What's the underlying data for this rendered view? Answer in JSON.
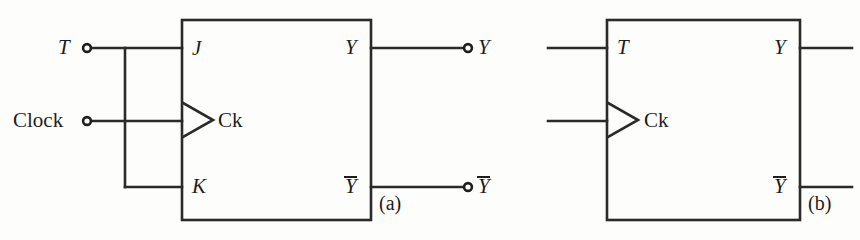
{
  "figure": {
    "background_color": "#fdfdfb",
    "line_color": "#2a2a2a",
    "text_color": "#1d1d1d"
  },
  "diagram_a": {
    "caption": "(a)",
    "external_inputs": [
      {
        "name": "T",
        "label": "T",
        "terminal": "open-circle"
      },
      {
        "name": "Clock",
        "label": "Clock",
        "terminal": "open-circle"
      }
    ],
    "box_input_pins": [
      {
        "name": "J",
        "label": "J"
      },
      {
        "name": "Ck",
        "label": "Ck"
      },
      {
        "name": "K",
        "label": "K"
      }
    ],
    "box_output_pins": [
      {
        "name": "Y",
        "label": "Y",
        "overbar": false
      },
      {
        "name": "Ybar",
        "label": "Y",
        "overbar": true
      }
    ],
    "external_outputs": [
      {
        "name": "Y",
        "label": "Y",
        "overbar": false,
        "terminal": "open-circle"
      },
      {
        "name": "Ybar",
        "label": "Y",
        "overbar": true,
        "terminal": "open-circle"
      }
    ],
    "clock_marker": "dynamic-edge-triangle",
    "notes": "T input branches to both J and K inputs"
  },
  "diagram_b": {
    "caption": "(b)",
    "box_input_pins": [
      {
        "name": "T",
        "label": "T"
      },
      {
        "name": "Ck",
        "label": "Ck"
      }
    ],
    "box_output_pins": [
      {
        "name": "Y",
        "label": "Y",
        "overbar": false
      },
      {
        "name": "Ybar",
        "label": "Y",
        "overbar": true
      }
    ],
    "clock_marker": "dynamic-edge-triangle"
  }
}
